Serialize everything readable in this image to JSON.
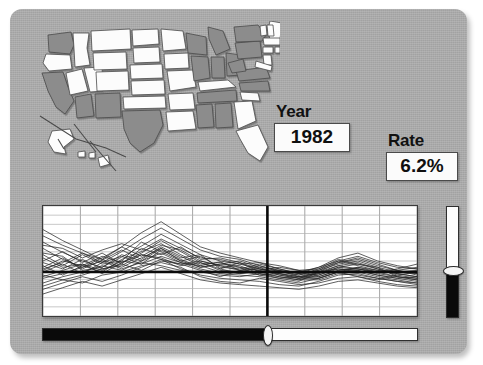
{
  "panel": {
    "background_color": "#a8a8a8"
  },
  "map": {
    "name": "united-states-choropleth",
    "selected_fill": "#8c8c8c",
    "unselected_fill": "#fcfcfc",
    "outline_color": "#4a4a4a"
  },
  "readouts": {
    "year": {
      "label": "Year",
      "value": "1982"
    },
    "rate": {
      "label": "Rate",
      "value": "6.2%"
    }
  },
  "chart_data": {
    "type": "line",
    "title": "",
    "xlabel": "",
    "ylabel": "",
    "grid": true,
    "legend": "none",
    "cursor_x_fraction": 0.6,
    "reference_line_y": 5.6,
    "x": [
      1976,
      1977,
      1978,
      1979,
      1980,
      1981,
      1982,
      1983,
      1984,
      1985,
      1986,
      1987,
      1988,
      1989,
      1990,
      1991,
      1992,
      1993,
      1994,
      1995
    ],
    "ylim": [
      0,
      14
    ],
    "xlim": [
      1976,
      1995
    ],
    "series": [
      {
        "name": "series-1",
        "values": [
          9.4,
          8.1,
          7.0,
          6.2,
          7.5,
          8.9,
          10.4,
          9.1,
          7.8,
          7.0,
          6.6,
          6.0,
          5.4,
          5.0,
          5.6,
          6.8,
          7.4,
          6.6,
          5.8,
          5.2
        ]
      },
      {
        "name": "series-2",
        "values": [
          6.2,
          7.4,
          6.0,
          7.1,
          8.4,
          7.2,
          8.8,
          7.6,
          6.4,
          6.9,
          5.8,
          6.4,
          5.6,
          5.2,
          6.0,
          7.2,
          6.6,
          6.0,
          5.4,
          5.0
        ]
      },
      {
        "name": "series-3",
        "values": [
          5.0,
          5.8,
          6.6,
          5.4,
          6.8,
          8.0,
          9.6,
          8.2,
          6.8,
          6.0,
          6.8,
          5.6,
          5.0,
          4.6,
          5.2,
          6.2,
          6.0,
          5.4,
          5.0,
          4.6
        ]
      },
      {
        "name": "series-4",
        "values": [
          7.8,
          6.4,
          7.8,
          6.6,
          7.0,
          9.4,
          8.2,
          7.0,
          7.6,
          6.2,
          6.0,
          6.6,
          6.0,
          5.4,
          5.8,
          6.6,
          7.0,
          6.2,
          5.6,
          5.4
        ]
      },
      {
        "name": "series-5",
        "values": [
          4.2,
          5.0,
          5.6,
          6.4,
          5.8,
          7.0,
          8.0,
          6.8,
          6.0,
          5.4,
          5.2,
          5.0,
          4.6,
          4.2,
          4.8,
          5.6,
          5.8,
          5.2,
          4.8,
          4.4
        ]
      },
      {
        "name": "series-6",
        "values": [
          8.6,
          7.2,
          6.2,
          7.4,
          8.8,
          7.6,
          9.0,
          8.4,
          7.0,
          6.4,
          6.2,
          5.8,
          5.2,
          4.8,
          5.4,
          6.4,
          6.8,
          6.0,
          5.2,
          4.8
        ]
      },
      {
        "name": "series-7",
        "values": [
          6.8,
          6.0,
          7.2,
          6.0,
          6.4,
          7.8,
          7.4,
          6.4,
          6.8,
          5.8,
          5.6,
          6.2,
          5.8,
          5.0,
          5.0,
          5.8,
          6.2,
          5.8,
          5.4,
          5.0
        ]
      },
      {
        "name": "series-8",
        "values": [
          5.6,
          6.6,
          5.4,
          6.8,
          7.6,
          6.6,
          8.4,
          7.2,
          6.2,
          6.6,
          6.4,
          5.4,
          4.8,
          4.4,
          5.6,
          6.0,
          5.6,
          5.0,
          4.6,
          4.2
        ]
      },
      {
        "name": "series-9",
        "values": [
          3.4,
          4.2,
          5.0,
          4.4,
          5.2,
          6.2,
          7.2,
          6.0,
          5.2,
          4.8,
          4.6,
          4.4,
          4.0,
          3.8,
          4.4,
          5.2,
          5.4,
          4.8,
          4.4,
          4.0
        ]
      },
      {
        "name": "series-10",
        "values": [
          7.0,
          8.2,
          6.8,
          8.0,
          6.6,
          8.6,
          7.8,
          8.8,
          7.2,
          7.4,
          6.8,
          6.0,
          5.6,
          5.6,
          6.2,
          7.0,
          6.4,
          5.8,
          5.6,
          5.8
        ]
      },
      {
        "name": "series-11",
        "values": [
          10.2,
          9.0,
          8.0,
          6.8,
          8.2,
          9.8,
          11.2,
          9.8,
          8.4,
          7.6,
          7.2,
          6.4,
          5.8,
          5.2,
          5.8,
          7.0,
          7.6,
          6.8,
          6.2,
          6.0
        ]
      },
      {
        "name": "series-12",
        "values": [
          4.8,
          5.4,
          6.2,
          7.0,
          6.0,
          6.8,
          6.4,
          5.8,
          5.6,
          5.2,
          5.0,
          5.4,
          5.0,
          4.6,
          4.6,
          5.4,
          5.2,
          4.8,
          4.4,
          4.2
        ]
      },
      {
        "name": "series-13",
        "values": [
          6.4,
          5.2,
          6.4,
          5.6,
          7.2,
          8.2,
          9.2,
          7.8,
          6.6,
          6.8,
          6.2,
          5.2,
          4.8,
          5.0,
          5.4,
          6.2,
          6.6,
          6.2,
          5.0,
          4.6
        ]
      },
      {
        "name": "series-14",
        "values": [
          8.0,
          7.6,
          5.8,
          6.2,
          7.8,
          7.0,
          8.6,
          7.4,
          7.8,
          6.0,
          5.4,
          5.8,
          6.2,
          5.8,
          5.0,
          5.8,
          6.0,
          5.6,
          6.0,
          6.6
        ]
      },
      {
        "name": "series-15",
        "values": [
          5.2,
          4.6,
          5.2,
          6.0,
          6.6,
          5.8,
          7.0,
          6.6,
          5.8,
          5.0,
          5.8,
          6.0,
          5.4,
          4.8,
          4.8,
          5.6,
          5.0,
          4.6,
          5.2,
          5.6
        ]
      },
      {
        "name": "series-16",
        "values": [
          9.0,
          8.6,
          7.4,
          8.4,
          9.2,
          8.4,
          9.8,
          8.6,
          7.4,
          7.2,
          6.6,
          6.8,
          6.4,
          5.8,
          6.0,
          6.8,
          7.2,
          6.4,
          5.8,
          5.4
        ]
      },
      {
        "name": "series-17",
        "values": [
          3.8,
          4.6,
          4.2,
          5.2,
          5.6,
          6.4,
          6.8,
          6.2,
          5.0,
          4.4,
          4.2,
          4.8,
          4.4,
          4.0,
          4.2,
          4.8,
          5.0,
          4.4,
          4.0,
          3.8
        ]
      },
      {
        "name": "series-18",
        "values": [
          6.0,
          6.8,
          8.0,
          7.2,
          6.2,
          7.4,
          8.6,
          7.0,
          6.2,
          6.6,
          7.0,
          6.2,
          5.2,
          4.8,
          5.6,
          6.4,
          6.0,
          5.6,
          5.8,
          6.2
        ]
      },
      {
        "name": "series-19",
        "values": [
          7.4,
          6.2,
          6.6,
          5.8,
          7.0,
          6.6,
          7.6,
          6.8,
          6.4,
          5.6,
          5.4,
          5.6,
          5.8,
          5.4,
          5.2,
          6.0,
          5.8,
          5.2,
          4.8,
          5.0
        ]
      },
      {
        "name": "series-20",
        "values": [
          2.8,
          3.6,
          4.4,
          3.8,
          4.6,
          5.4,
          6.2,
          5.4,
          4.6,
          4.2,
          4.0,
          3.8,
          3.6,
          3.4,
          3.8,
          4.4,
          4.6,
          4.2,
          3.8,
          3.6
        ]
      },
      {
        "name": "series-21",
        "values": [
          11.0,
          9.6,
          8.4,
          7.2,
          8.8,
          10.6,
          12.0,
          10.4,
          8.8,
          8.0,
          7.4,
          6.8,
          6.0,
          5.4,
          6.2,
          7.4,
          8.0,
          7.0,
          6.4,
          6.0
        ]
      },
      {
        "name": "series-22",
        "values": [
          5.8,
          7.0,
          6.4,
          7.6,
          6.8,
          7.8,
          7.2,
          6.6,
          7.0,
          6.4,
          5.8,
          5.2,
          5.4,
          5.0,
          4.8,
          5.6,
          6.2,
          5.6,
          5.0,
          4.8
        ]
      }
    ]
  },
  "time_slider": {
    "name": "year-slider",
    "orientation": "horizontal",
    "value_fraction": 0.6
  },
  "range_slider": {
    "name": "rate-scale-slider",
    "orientation": "vertical",
    "value_fraction": 0.57
  }
}
